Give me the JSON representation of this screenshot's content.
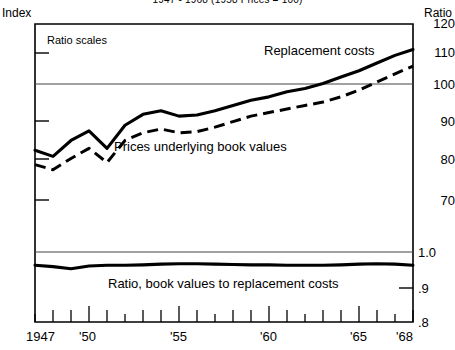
{
  "title": "1947 - 1968 (1958 Prices = 100)",
  "axis_headers": {
    "left": "Index",
    "right": "Ratio"
  },
  "annotations": {
    "ratio_scales": "Ratio scales",
    "replacement_costs": "Replacement costs",
    "prices_underlying": "Prices underlying book values",
    "ratio_label": "Ratio, book values to replacement costs"
  },
  "ticks": {
    "index": [
      "120",
      "110",
      "100",
      "90",
      "80",
      "70"
    ],
    "ratio": [
      "1.0",
      ".9",
      ".8"
    ],
    "years": [
      "1947",
      "'50",
      "'55",
      "'60",
      "'65",
      "'68"
    ]
  },
  "colors": {
    "ink": "#000000",
    "grid": "#555555",
    "bg": "#ffffff"
  },
  "chart_data": {
    "type": "line",
    "title": "1947 - 1968 (1958 Prices = 100)",
    "xlabel": "",
    "ylabel": "Index",
    "y2label": "Ratio",
    "scale": "log",
    "grid": false,
    "legend": "inline-annotations",
    "ylim": [
      70,
      120
    ],
    "y2lim": [
      0.8,
      1.0
    ],
    "x": [
      1947,
      1948,
      1949,
      1950,
      1951,
      1952,
      1953,
      1954,
      1955,
      1956,
      1957,
      1958,
      1959,
      1960,
      1961,
      1962,
      1963,
      1964,
      1965,
      1966,
      1967,
      1968
    ],
    "panels": [
      {
        "name": "index-panel",
        "ylim": [
          70,
          120
        ],
        "yticks": [
          70,
          80,
          90,
          100,
          110,
          120
        ],
        "series": [
          {
            "name": "Replacement costs",
            "style": "solid",
            "values": [
              81.5,
              80.0,
              84.0,
              86.5,
              82.0,
              88.0,
              91.0,
              92.0,
              90.5,
              90.8,
              92.0,
              93.5,
              95.0,
              96.0,
              97.5,
              98.5,
              100.0,
              102.0,
              104.0,
              106.5,
              109.0,
              111.0
            ]
          },
          {
            "name": "Prices underlying book values",
            "style": "dashed",
            "values": [
              78.0,
              76.8,
              79.5,
              82.0,
              78.5,
              84.0,
              86.0,
              87.0,
              86.0,
              86.3,
              87.5,
              89.0,
              90.5,
              91.5,
              92.5,
              93.5,
              94.5,
              96.0,
              98.0,
              100.5,
              103.0,
              105.5
            ]
          }
        ]
      },
      {
        "name": "ratio-panel",
        "y2lim": [
          0.8,
          1.0
        ],
        "y2ticks": [
          0.8,
          0.9,
          1.0
        ],
        "series": [
          {
            "name": "Ratio, book values to replacement costs",
            "style": "solid",
            "values": [
              0.962,
              0.958,
              0.952,
              0.96,
              0.962,
              0.962,
              0.963,
              0.965,
              0.966,
              0.966,
              0.965,
              0.964,
              0.963,
              0.963,
              0.962,
              0.962,
              0.962,
              0.963,
              0.965,
              0.966,
              0.965,
              0.962
            ]
          }
        ]
      }
    ]
  }
}
